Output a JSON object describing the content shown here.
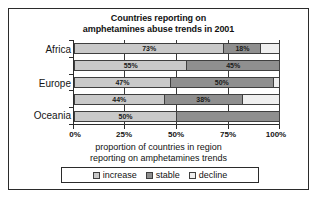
{
  "chart_data": {
    "type": "bar",
    "orientation": "horizontal",
    "stacked": true,
    "normalized_percent": true,
    "title": "Countries reporting on amphetamines abuse trends in 2001",
    "title_line1": "Countries reporting on",
    "title_line2": "amphetamines abuse trends in 2001",
    "xlabel": "proportion of countries in region reporting on amphetamines trends",
    "xlabel_line1": "proportion of countries in region",
    "xlabel_line2": "reporting on amphetamines trends",
    "ylabel": "",
    "xlim": [
      0,
      100
    ],
    "xticks": [
      0,
      25,
      50,
      75,
      100
    ],
    "xticklabels": [
      "0%",
      "25%",
      "50%",
      "75%",
      "100%"
    ],
    "grid": true,
    "legend_position": "bottom",
    "categories": [
      "Africa",
      "",
      "Europe",
      "",
      "Oceania"
    ],
    "yticklabels": [
      "Africa",
      "Europe",
      "Oceania"
    ],
    "series": [
      {
        "name": "increase",
        "color": "#c9c9c9",
        "values": [
          73,
          55,
          47,
          44,
          50
        ]
      },
      {
        "name": "stable",
        "color": "#8f8f8f",
        "values": [
          18,
          45,
          50,
          38,
          50
        ]
      },
      {
        "name": "decline",
        "color": "#efefef",
        "values": [
          9,
          0,
          3,
          18,
          0
        ]
      }
    ],
    "bars": [
      {
        "category": "Africa",
        "segments": [
          {
            "series": "increase",
            "value": 73,
            "label": "73%"
          },
          {
            "series": "stable",
            "value": 18,
            "label": "18%"
          },
          {
            "series": "decline",
            "value": 9,
            "label": ""
          }
        ]
      },
      {
        "category": "",
        "segments": [
          {
            "series": "increase",
            "value": 55,
            "label": "55%"
          },
          {
            "series": "stable",
            "value": 45,
            "label": "45%"
          },
          {
            "series": "decline",
            "value": 0,
            "label": ""
          }
        ]
      },
      {
        "category": "Europe",
        "segments": [
          {
            "series": "increase",
            "value": 47,
            "label": "47%"
          },
          {
            "series": "stable",
            "value": 50,
            "label": "50%"
          },
          {
            "series": "decline",
            "value": 3,
            "label": ""
          }
        ]
      },
      {
        "category": "",
        "segments": [
          {
            "series": "increase",
            "value": 44,
            "label": "44%"
          },
          {
            "series": "stable",
            "value": 38,
            "label": "38%"
          },
          {
            "series": "decline",
            "value": 18,
            "label": ""
          }
        ]
      },
      {
        "category": "Oceania",
        "segments": [
          {
            "series": "increase",
            "value": 50,
            "label": "50%"
          },
          {
            "series": "stable",
            "value": 50,
            "label": ""
          },
          {
            "series": "decline",
            "value": 0,
            "label": ""
          }
        ]
      }
    ],
    "legend": [
      {
        "label": "increase",
        "color": "#c9c9c9"
      },
      {
        "label": "stable",
        "color": "#8f8f8f"
      },
      {
        "label": "decline",
        "color": "#efefef"
      }
    ]
  }
}
